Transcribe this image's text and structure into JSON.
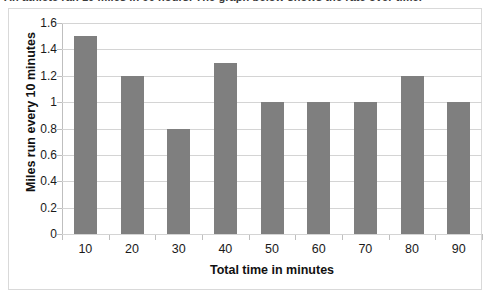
{
  "page": {
    "top_partial_caption": "An athlete ran 10 miles in 90 hours. The graph below shows the rate over time."
  },
  "chart_data": {
    "type": "bar",
    "title": "",
    "subtitle": "",
    "xlabel": "Total time in minutes",
    "ylabel": "Miles run every 10 minutes",
    "categories": [
      "10",
      "20",
      "30",
      "40",
      "50",
      "60",
      "70",
      "80",
      "90"
    ],
    "values": [
      1.5,
      1.2,
      0.8,
      1.3,
      1.0,
      1.0,
      1.0,
      1.2,
      1.0
    ],
    "ylim": [
      0,
      1.6
    ],
    "ytick_labels": [
      "1.6",
      "1.4",
      "1.2",
      "1",
      "0.8",
      "0.6",
      "0.4",
      "0.2",
      "0"
    ],
    "ytick_values": [
      1.6,
      1.4,
      1.2,
      1.0,
      0.8,
      0.6,
      0.4,
      0.2,
      0
    ],
    "grid": true,
    "grid_axis": "y",
    "legend": false,
    "legend_position": "none",
    "bar_color": "#7f7f7f",
    "grid_color": "#d4d4d4",
    "axis_color": "#bfbfbf",
    "background_color": "#ffffff",
    "border_color": "#d9d9d9"
  }
}
